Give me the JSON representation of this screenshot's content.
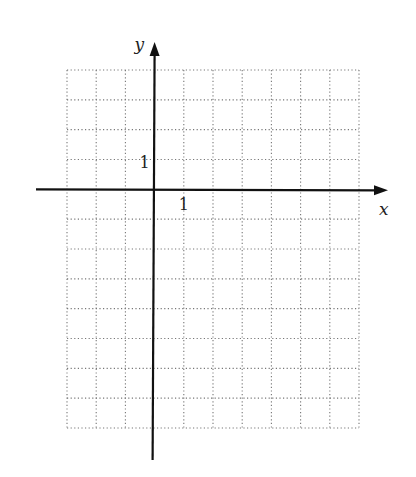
{
  "chart_data": {
    "type": "grid",
    "title": "",
    "xlabel": "x",
    "ylabel": "y",
    "xlim": [
      -3,
      7
    ],
    "ylim": [
      -8,
      4
    ],
    "grid": true,
    "grid_style": "dotted",
    "tick_labels": [
      {
        "axis": "x",
        "value": 1,
        "label": "1"
      },
      {
        "axis": "y",
        "value": 1,
        "label": "1"
      }
    ],
    "series": []
  },
  "colors": {
    "axis": "#111111",
    "grid": "#777777",
    "background": "#ffffff"
  },
  "layout": {
    "grid_left_px": 67,
    "grid_right_px": 359,
    "grid_top_px": 70,
    "grid_bottom_px": 428,
    "origin_px": [
      154,
      190
    ],
    "x_axis_extent_px": [
      36,
      388
    ],
    "y_axis_extent_px": [
      42,
      460
    ]
  }
}
